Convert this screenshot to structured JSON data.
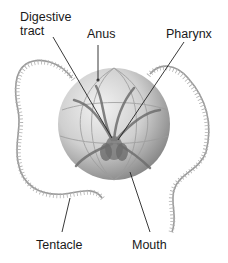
{
  "diagram": {
    "labels": {
      "digestive_tract_line1": "Digestive",
      "digestive_tract_line2": "tract",
      "anus": "Anus",
      "pharynx": "Pharynx",
      "tentacle": "Tentacle",
      "mouth": "Mouth"
    },
    "colors": {
      "body_light": "#eeeeee",
      "body_dark": "#8a8a8a",
      "tentacle": "#9a9a9a",
      "leader_line": "#222222",
      "text": "#1a1a1a"
    }
  }
}
